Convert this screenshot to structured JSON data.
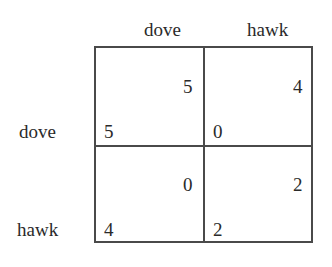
{
  "column_headers": [
    "dove",
    "hawk"
  ],
  "row_headers": [
    "dove",
    "hawk"
  ],
  "cells": [
    [
      {
        "column_payoff": "5",
        "row_payoff": "5"
      },
      {
        "column_payoff": "4",
        "row_payoff": "0"
      }
    ],
    [
      {
        "column_payoff": "0",
        "row_payoff": "4"
      },
      {
        "column_payoff": "2",
        "row_payoff": "2"
      }
    ]
  ],
  "colors": {
    "line": "#4a4a4a",
    "text": "#2a2a2a",
    "background": "#ffffff"
  }
}
